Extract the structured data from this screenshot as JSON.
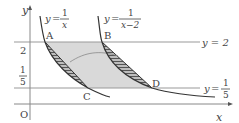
{
  "diagram": {
    "axes": {
      "x_label": "x",
      "y_label": "y",
      "origin_label": "O"
    },
    "y_ticks": [
      {
        "label": "2",
        "value": 2
      },
      {
        "label_num": "1",
        "label_den": "5",
        "value": 0.2
      }
    ],
    "curves": [
      {
        "name": "y=1/x",
        "label_lhs": "y",
        "label_eq": "=",
        "num": "1",
        "den": "x"
      },
      {
        "name": "y=1/(x-2)",
        "label_lhs": "y",
        "label_eq": "=",
        "num": "1",
        "den": "x−2"
      }
    ],
    "lines": [
      {
        "name": "y=2",
        "label": "y = 2"
      },
      {
        "name": "y=1/5",
        "label_lhs": "y",
        "label_eq": "=",
        "num": "1",
        "den": "5"
      }
    ],
    "points": [
      {
        "label": "A"
      },
      {
        "label": "B"
      },
      {
        "label": "C"
      },
      {
        "label": "D"
      }
    ],
    "colors": {
      "curve": "#333333",
      "line": "#888888",
      "shade_light": "#d6d6d6",
      "hatch": "#555555",
      "text": "#444444"
    }
  }
}
